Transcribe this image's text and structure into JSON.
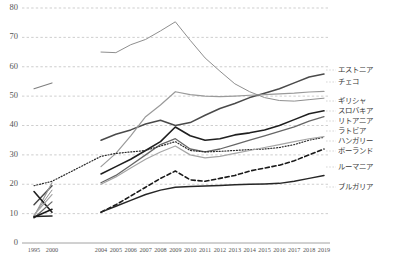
{
  "chart_data": {
    "type": "line",
    "title": "",
    "xlabel": "",
    "ylabel": "",
    "ylim": [
      0,
      80
    ],
    "yticks": [
      0,
      10,
      20,
      30,
      40,
      50,
      60,
      70,
      80
    ],
    "grid": true,
    "legend_position": "right",
    "x": [
      "1995",
      "2000",
      "2004",
      "2005",
      "2006",
      "2007",
      "2008",
      "2009",
      "2010",
      "2011",
      "2012",
      "2013",
      "2014",
      "2015",
      "2016",
      "2017",
      "2018",
      "2019"
    ],
    "series": [
      {
        "name": "エストニア",
        "name_en": "Estonia",
        "color": "#8f8f8f",
        "style": "solid",
        "width": 1.0,
        "values": [
          null,
          null,
          65.0,
          64.8,
          67.5,
          69.3,
          72.2,
          75.3,
          69.0,
          63.0,
          58.5,
          54.2,
          51.5,
          49.5,
          48.5,
          48.3,
          48.8,
          49.3
        ]
      },
      {
        "name": "チェコ",
        "name_en": "Czech",
        "color": "#4a4a4a",
        "style": "solid",
        "width": 1.5,
        "values": [
          null,
          null,
          35.0,
          37.0,
          38.5,
          40.5,
          41.8,
          40.0,
          41.0,
          43.5,
          45.8,
          47.5,
          49.5,
          51.0,
          52.5,
          54.5,
          56.5,
          57.5
        ]
      },
      {
        "name": "ギリシャ",
        "name_en": "Greece",
        "color": "#7f7f7f",
        "style": "solid",
        "width": 1.1,
        "values": [
          52.5,
          54.5,
          null,
          null,
          null,
          null,
          null,
          null,
          null,
          null,
          null,
          null,
          null,
          null,
          null,
          null,
          null,
          null
        ]
      },
      {
        "name": "スロバキア",
        "name_en": "Slovakia",
        "color": "#9a9a9a",
        "style": "solid",
        "width": 1.2,
        "values": [
          null,
          null,
          26.0,
          30.5,
          36.5,
          43.0,
          47.0,
          51.5,
          50.5,
          50.0,
          49.8,
          50.0,
          50.3,
          50.5,
          50.8,
          51.0,
          51.4,
          51.6
        ]
      },
      {
        "name": "リトアニア",
        "name_en": "Lithuania",
        "color": "#1f1f1f",
        "style": "solid",
        "width": 1.6,
        "values": [
          null,
          null,
          23.5,
          26.0,
          28.5,
          31.5,
          34.5,
          39.5,
          36.5,
          35.0,
          35.5,
          36.8,
          37.5,
          38.5,
          40.0,
          42.0,
          44.0,
          45.0
        ]
      },
      {
        "name": "ラトビア",
        "name_en": "Latvia",
        "color": "#666666",
        "style": "solid",
        "width": 1.3,
        "values": [
          null,
          null,
          20.5,
          23.0,
          26.5,
          30.0,
          33.5,
          35.5,
          32.0,
          31.0,
          32.0,
          33.5,
          35.0,
          36.5,
          38.0,
          39.5,
          41.5,
          43.0
        ]
      },
      {
        "name": "ハンガリー",
        "name_en": "Hungary",
        "color": "#2b2b2b",
        "style": "dotted",
        "width": 1.2,
        "values": [
          19.5,
          21.0,
          29.5,
          30.5,
          31.0,
          31.5,
          33.0,
          34.5,
          31.5,
          31.0,
          31.2,
          31.5,
          31.8,
          32.0,
          32.5,
          33.5,
          35.0,
          36.0
        ]
      },
      {
        "name": "ポーランド",
        "name_en": "Poland",
        "color": "#a5a5a5",
        "style": "solid",
        "width": 1.2,
        "values": [
          null,
          null,
          20.0,
          22.5,
          25.5,
          28.5,
          31.0,
          33.0,
          30.0,
          29.0,
          29.5,
          30.5,
          31.5,
          32.5,
          33.5,
          34.5,
          35.5,
          36.2
        ]
      },
      {
        "name": "ルーマニア",
        "name_en": "Romania",
        "color": "#1a1a1a",
        "style": "dashed",
        "width": 1.6,
        "values": [
          null,
          null,
          10.5,
          13.0,
          16.0,
          19.0,
          22.0,
          24.5,
          21.5,
          21.0,
          22.0,
          23.0,
          24.5,
          25.5,
          26.5,
          28.0,
          30.0,
          32.0
        ]
      },
      {
        "name": "ブルガリア",
        "name_en": "Bulgaria",
        "color": "#262626",
        "style": "solid",
        "width": 1.5,
        "values": [
          null,
          null,
          10.5,
          12.5,
          14.5,
          16.5,
          18.0,
          19.0,
          19.2,
          19.4,
          19.6,
          19.8,
          20.0,
          20.1,
          20.3,
          21.0,
          22.0,
          23.0
        ]
      }
    ],
    "early_segments": [
      {
        "name": "エストニア-early",
        "color": "#8f8f8f",
        "width": 1.0,
        "style": "solid",
        "points": [
          [
            1995,
            9.5
          ],
          [
            2000,
            18.0
          ]
        ]
      },
      {
        "name": "チェコ-early",
        "color": "#4a4a4a",
        "width": 1.5,
        "style": "solid",
        "points": [
          [
            1995,
            13.0
          ],
          [
            2000,
            19.5
          ]
        ]
      },
      {
        "name": "スロバキア-early",
        "color": "#9a9a9a",
        "width": 1.2,
        "style": "solid",
        "points": [
          [
            1995,
            9.0
          ],
          [
            2000,
            20.5
          ]
        ]
      },
      {
        "name": "リトアニア-early",
        "color": "#1f1f1f",
        "width": 1.6,
        "style": "solid",
        "points": [
          [
            1995,
            17.5
          ],
          [
            2000,
            10.5
          ]
        ]
      },
      {
        "name": "ラトビア-early",
        "color": "#666666",
        "width": 1.3,
        "style": "solid",
        "points": [
          [
            1995,
            8.5
          ],
          [
            2000,
            14.0
          ]
        ]
      },
      {
        "name": "ポーランド-early",
        "color": "#a5a5a5",
        "width": 1.2,
        "style": "solid",
        "points": [
          [
            1995,
            9.5
          ],
          [
            2000,
            16.5
          ]
        ]
      },
      {
        "name": "ブルガリア-early",
        "color": "#262626",
        "width": 1.5,
        "style": "solid",
        "points": [
          [
            1995,
            9.0
          ],
          [
            2000,
            9.2
          ]
        ]
      },
      {
        "name": "ルーマニア-early",
        "color": "#1a1a1a",
        "width": 1.6,
        "style": "solid",
        "points": [
          [
            1995,
            8.8
          ],
          [
            2000,
            11.5
          ]
        ]
      }
    ],
    "legend_entries": [
      {
        "label": "エストニア",
        "y": 70
      },
      {
        "label": "チェコ",
        "y": 82
      },
      {
        "label": "ギリシャ",
        "y": 101
      },
      {
        "label": "スロバキア",
        "y": 111
      },
      {
        "label": "リトアニア",
        "y": 121
      },
      {
        "label": "ラトビア",
        "y": 131
      },
      {
        "label": "ハンガリー",
        "y": 141
      },
      {
        "label": "ポーランド",
        "y": 151
      },
      {
        "label": "ルーマニア",
        "y": 167
      },
      {
        "label": "ブルガリア",
        "y": 187
      }
    ]
  }
}
